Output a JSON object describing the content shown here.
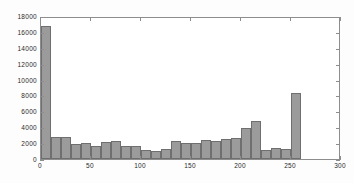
{
  "chart_data": {
    "type": "bar",
    "title": "",
    "subtitle": "",
    "xlabel": "",
    "ylabel": "",
    "xlim": [
      0,
      300
    ],
    "ylim": [
      0,
      18000
    ],
    "grid": false,
    "legend": null,
    "bin_width": 10,
    "bar_fill_color": "#9b9b9b",
    "bar_edge_color": "#6f6f6f",
    "axis_color": "#8d8d8d",
    "background_color": "#ffffff",
    "xticks": [
      0,
      50,
      100,
      150,
      200,
      250,
      300
    ],
    "xtick_labels": [
      "0",
      "50",
      "100",
      "150",
      "200",
      "250",
      "300"
    ],
    "yticks": [
      0,
      2000,
      4000,
      6000,
      8000,
      10000,
      12000,
      14000,
      16000,
      18000
    ],
    "ytick_labels": [
      "0",
      "2000",
      "4000",
      "6000",
      "8000",
      "10000",
      "12000",
      "14000",
      "16000",
      "18000"
    ],
    "bins": [
      {
        "x0": 0,
        "x1": 10,
        "value": 16700
      },
      {
        "x0": 10,
        "x1": 20,
        "value": 2750
      },
      {
        "x0": 20,
        "x1": 30,
        "value": 2800
      },
      {
        "x0": 30,
        "x1": 40,
        "value": 1950
      },
      {
        "x0": 40,
        "x1": 50,
        "value": 2000
      },
      {
        "x0": 50,
        "x1": 60,
        "value": 1600
      },
      {
        "x0": 60,
        "x1": 70,
        "value": 2150
      },
      {
        "x0": 70,
        "x1": 80,
        "value": 2250
      },
      {
        "x0": 80,
        "x1": 90,
        "value": 1700
      },
      {
        "x0": 90,
        "x1": 100,
        "value": 1600
      },
      {
        "x0": 100,
        "x1": 110,
        "value": 1150
      },
      {
        "x0": 110,
        "x1": 120,
        "value": 1050
      },
      {
        "x0": 120,
        "x1": 130,
        "value": 1250
      },
      {
        "x0": 130,
        "x1": 140,
        "value": 2250
      },
      {
        "x0": 140,
        "x1": 150,
        "value": 2000
      },
      {
        "x0": 150,
        "x1": 160,
        "value": 2050
      },
      {
        "x0": 160,
        "x1": 170,
        "value": 2350
      },
      {
        "x0": 170,
        "x1": 180,
        "value": 2250
      },
      {
        "x0": 180,
        "x1": 190,
        "value": 2500
      },
      {
        "x0": 190,
        "x1": 200,
        "value": 2600
      },
      {
        "x0": 200,
        "x1": 210,
        "value": 3850
      },
      {
        "x0": 210,
        "x1": 220,
        "value": 4800
      },
      {
        "x0": 220,
        "x1": 230,
        "value": 1150
      },
      {
        "x0": 230,
        "x1": 240,
        "value": 1400
      },
      {
        "x0": 240,
        "x1": 250,
        "value": 1200
      },
      {
        "x0": 250,
        "x1": 260,
        "value": 8350
      }
    ]
  }
}
